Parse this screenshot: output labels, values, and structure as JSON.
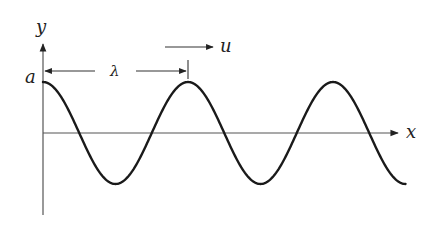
{
  "diagram": {
    "labels": {
      "y_axis": "y",
      "x_axis": "x",
      "amplitude": "a",
      "wavelength": "λ",
      "velocity": "u"
    },
    "colors": {
      "curve": "#1a1a1a",
      "axis": "#555555",
      "text": "#222222"
    },
    "wave": {
      "type": "cosine",
      "cycles_shown": 2.5,
      "origin_px": [
        43,
        133
      ],
      "amplitude_px": 51,
      "wavelength_px": 145
    }
  }
}
